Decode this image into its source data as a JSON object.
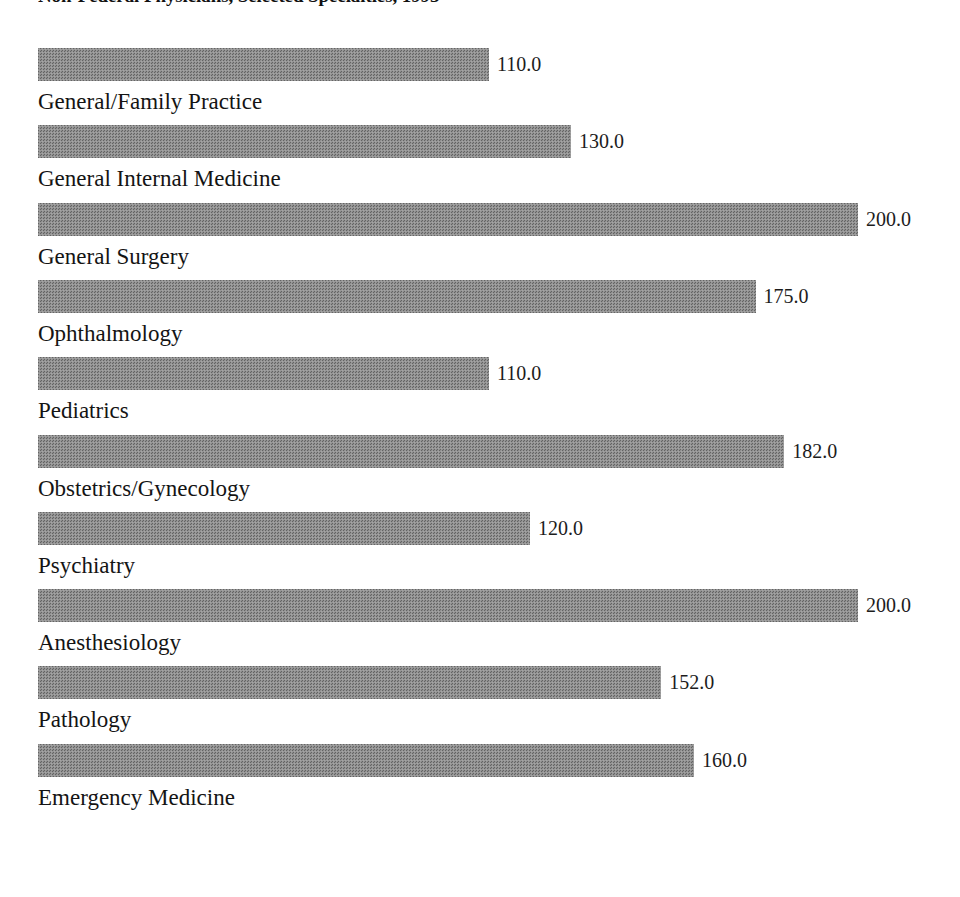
{
  "chart_data": {
    "type": "bar",
    "orientation": "horizontal",
    "title": "Non-Federal Physicians, Selected Specialties, 1993",
    "xlabel": "",
    "ylabel": "",
    "grid": false,
    "legend": "none",
    "xlim": [
      0,
      200
    ],
    "categories": [
      "General/Family Practice",
      "General Internal Medicine",
      "General Surgery",
      "Ophthalmology",
      "Pediatrics",
      "Obstetrics/Gynecology",
      "Psychiatry",
      "Anesthesiology",
      "Pathology",
      "Emergency Medicine"
    ],
    "values": [
      110.0,
      130.0,
      200.0,
      175.0,
      110.0,
      182.0,
      120.0,
      200.0,
      152.0,
      160.0
    ],
    "value_labels": [
      "110.0",
      "130.0",
      "200.0",
      "175.0",
      "110.0",
      "182.0",
      "120.0",
      "200.0",
      "152.0",
      "160.0"
    ],
    "bar_color": "#8d8d8d",
    "background_color": "#ffffff",
    "text_color": "#141414"
  },
  "bars": [
    {
      "label": "General/Family Practice",
      "value": 110.0,
      "value_label": "110.0"
    },
    {
      "label": "General Internal Medicine",
      "value": 130.0,
      "value_label": "130.0"
    },
    {
      "label": "General Surgery",
      "value": 200.0,
      "value_label": "200.0"
    },
    {
      "label": "Ophthalmology",
      "value": 175.0,
      "value_label": "175.0"
    },
    {
      "label": "Pediatrics",
      "value": 110.0,
      "value_label": "110.0"
    },
    {
      "label": "Obstetrics/Gynecology",
      "value": 182.0,
      "value_label": "182.0"
    },
    {
      "label": "Psychiatry",
      "value": 120.0,
      "value_label": "120.0"
    },
    {
      "label": "Anesthesiology",
      "value": 200.0,
      "value_label": "200.0"
    },
    {
      "label": "Pathology",
      "value": 152.0,
      "value_label": "152.0"
    },
    {
      "label": "Emergency Medicine",
      "value": 160.0,
      "value_label": "160.0"
    }
  ],
  "layout": {
    "bar_origin_x": 38,
    "px_per_unit": 4.1,
    "first_bar_top": 48,
    "row_pitch": 77.3,
    "bar_height": 33,
    "value_gap": 8,
    "label_offset": 6
  }
}
